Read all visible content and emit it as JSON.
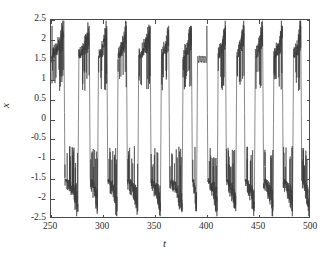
{
  "chart_data": {
    "type": "line",
    "title": "",
    "subtitle": "",
    "xlabel": "t",
    "ylabel": "x",
    "xlim": [
      250,
      500
    ],
    "ylim": [
      -2.5,
      2.5
    ],
    "xticks": [
      250,
      300,
      350,
      400,
      450,
      500
    ],
    "yticks": [
      -2.5,
      -2,
      -1.5,
      -1,
      -0.5,
      0,
      0.5,
      1,
      1.5,
      2,
      2.5
    ],
    "xtick_labels": [
      "250",
      "300",
      "350",
      "400",
      "450",
      "500"
    ],
    "ytick_labels": [
      "2.5",
      "2",
      "1.5",
      "1",
      "0.5",
      "0",
      "-0.5",
      "-1",
      "-1.5",
      "-2",
      "-2.5"
    ],
    "grid": false,
    "legend": null,
    "line_color": "#3a3a3a",
    "line_width": 0.6,
    "axis_color": "#4a4a4a",
    "background": "#ffffff",
    "well_centers": [
      1.5,
      -1.5
    ],
    "burst_peak_max": 2.4,
    "burst_peak_min": -2.4,
    "series": [
      {
        "name": "x(t)",
        "color": "#3a3a3a",
        "segments": [
          {
            "well": "upper",
            "t_start": 250.0,
            "t_end": 251.0,
            "quiet": true
          },
          {
            "well": "upper",
            "t_start": 251.0,
            "t_end": 262.5,
            "burst": true
          },
          {
            "well": "lower",
            "t_start": 263.5,
            "t_end": 276.0,
            "burst": true
          },
          {
            "well": "upper",
            "t_start": 277.0,
            "t_end": 287.0,
            "burst": true
          },
          {
            "well": "lower",
            "t_start": 288.0,
            "t_end": 295.0,
            "burst": true
          },
          {
            "well": "upper",
            "t_start": 296.0,
            "t_end": 304.0,
            "burst": true
          },
          {
            "well": "lower",
            "t_start": 305.0,
            "t_end": 314.0,
            "burst": true
          },
          {
            "well": "upper",
            "t_start": 315.0,
            "t_end": 323.0,
            "burst": true
          },
          {
            "well": "lower",
            "t_start": 324.0,
            "t_end": 334.0,
            "burst": true
          },
          {
            "well": "upper",
            "t_start": 335.0,
            "t_end": 346.0,
            "burst": true
          },
          {
            "well": "lower",
            "t_start": 347.0,
            "t_end": 356.0,
            "burst": true
          },
          {
            "well": "upper",
            "t_start": 357.0,
            "t_end": 364.0,
            "burst": true
          },
          {
            "well": "lower",
            "t_start": 365.0,
            "t_end": 377.0,
            "burst": true
          },
          {
            "well": "upper",
            "t_start": 378.0,
            "t_end": 386.0,
            "burst": true
          },
          {
            "well": "lower",
            "t_start": 387.0,
            "t_end": 391.0,
            "burst": true
          },
          {
            "well": "upper",
            "t_start": 392.0,
            "t_end": 401.0,
            "quiet": true
          },
          {
            "well": "lower",
            "t_start": 402.0,
            "t_end": 411.0,
            "burst": true
          },
          {
            "well": "upper",
            "t_start": 412.0,
            "t_end": 419.0,
            "burst": true
          },
          {
            "well": "lower",
            "t_start": 420.0,
            "t_end": 429.0,
            "burst": true
          },
          {
            "well": "upper",
            "t_start": 430.0,
            "t_end": 437.0,
            "burst": true
          },
          {
            "well": "lower",
            "t_start": 438.0,
            "t_end": 447.0,
            "burst": true
          },
          {
            "well": "upper",
            "t_start": 448.0,
            "t_end": 455.0,
            "burst": true
          },
          {
            "well": "lower",
            "t_start": 456.0,
            "t_end": 465.0,
            "burst": true
          },
          {
            "well": "upper",
            "t_start": 466.0,
            "t_end": 474.0,
            "burst": true
          },
          {
            "well": "lower",
            "t_start": 475.0,
            "t_end": 484.0,
            "burst": true
          },
          {
            "well": "upper",
            "t_start": 485.0,
            "t_end": 492.0,
            "burst": true
          },
          {
            "well": "lower",
            "t_start": 493.0,
            "t_end": 500.0,
            "burst": true
          }
        ]
      }
    ]
  }
}
